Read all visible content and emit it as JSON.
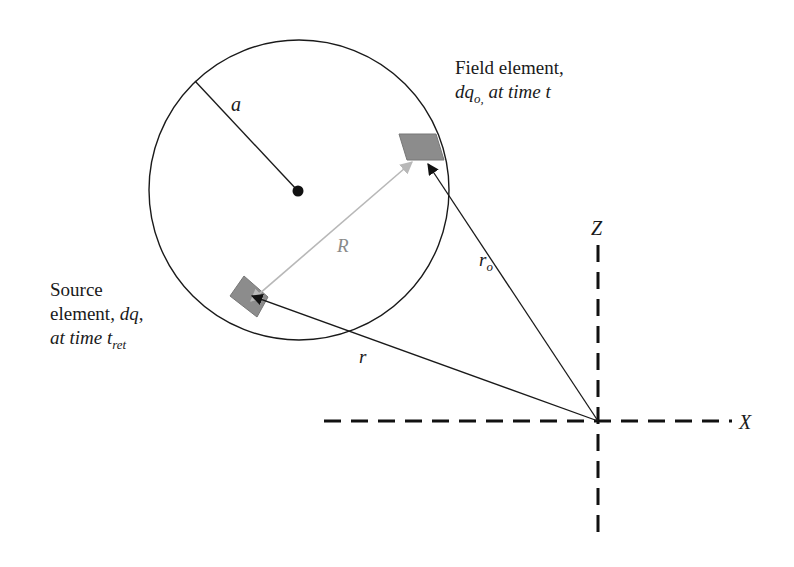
{
  "diagram": {
    "labels": {
      "radius": "a",
      "separation": "R",
      "source_vector": "r",
      "field_vector": "r",
      "field_vector_sub": "o",
      "z_axis": "Z",
      "x_axis": "X"
    },
    "field_element": {
      "line1": "Field element,",
      "line2_var": "dq",
      "line2_sub": "o,",
      "line2_rest": " at time t"
    },
    "source_element": {
      "line1": "Source",
      "line2_text": "element, ",
      "line2_var": "dq",
      "line2_comma": ",",
      "line3_text": "at time t",
      "line3_sub": "ret"
    },
    "colors": {
      "stroke": "#1a1a1a",
      "element_fill": "#8c8c8c",
      "R_arrow": "#b8b8b8"
    },
    "geometry": {
      "circle": {
        "cx": 299,
        "cy": 190,
        "r": 150
      },
      "origin": {
        "x": 598,
        "y": 421
      }
    }
  }
}
